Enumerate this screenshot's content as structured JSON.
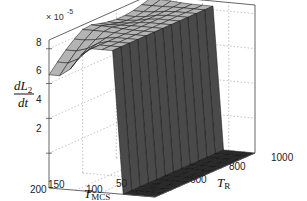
{
  "chart_data": {
    "type": "surface3d",
    "title": "",
    "zlabel": {
      "main": "dL",
      "sub": "2",
      "denominator": "dt"
    },
    "xlabel": {
      "main": "T",
      "sub": "R"
    },
    "ylabel": {
      "main": "T",
      "sub": "MCS"
    },
    "z_multiplier": "× 10",
    "z_exponent": "-5",
    "z_ticks": [
      "2",
      "4",
      "6",
      "8"
    ],
    "x_ticks": [
      "600",
      "800",
      "1000"
    ],
    "y_ticks": [
      "200",
      "150",
      "100",
      "50",
      "0"
    ],
    "xlim": [
      400,
      1000
    ],
    "ylim": [
      0,
      200
    ],
    "zlim": [
      0,
      8.5
    ],
    "grid": true,
    "x": [
      400,
      450,
      500,
      550,
      600,
      650,
      700,
      750,
      800,
      850,
      900,
      950,
      1000
    ],
    "y": [
      0,
      20,
      40,
      60,
      80,
      100,
      120,
      140,
      160,
      180,
      200
    ],
    "z_description": "z ≈ 0 for T_MCS below ~60; rises sharply to a plateau ~6.5–8.5 (×1e-5) for T_MCS ≥ 70; plateau higher (~8.3) at large T_R/high T_MCS, lower (~6.6) near T_R=400 with T_MCS ≥ 150",
    "colors": {
      "surface_top": "#b4b4b4",
      "surface_side": "#4a4a4a",
      "floor": "#2a2a2a",
      "edge": "#111111",
      "box": "#555555",
      "grid": "#999999"
    }
  }
}
